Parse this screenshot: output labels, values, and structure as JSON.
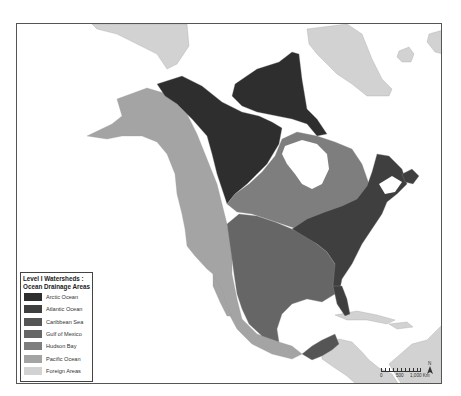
{
  "map": {
    "legend": {
      "title_line1": "Level I Watersheds :",
      "title_line2": "Ocean Drainage Areas",
      "items": [
        {
          "label": "Arctic Ocean",
          "color": "#2e2e2e"
        },
        {
          "label": "Atlantic Ocean",
          "color": "#3f3f3f"
        },
        {
          "label": "Caribbean Sea",
          "color": "#555555"
        },
        {
          "label": "Gulf of Mexico",
          "color": "#666666"
        },
        {
          "label": "Hudson Bay",
          "color": "#7e7e7e"
        },
        {
          "label": "Pacific Ocean",
          "color": "#a4a4a4"
        },
        {
          "label": "Foreign Areas",
          "color": "#d2d2d2"
        }
      ]
    },
    "scale_bar": {
      "labels": [
        "0",
        "500",
        "1,000 Km"
      ]
    },
    "north_arrow": {
      "label": "N"
    },
    "colors": {
      "water": "#ffffff",
      "frame": "#555555",
      "rivers": "#9a9a9a"
    }
  }
}
